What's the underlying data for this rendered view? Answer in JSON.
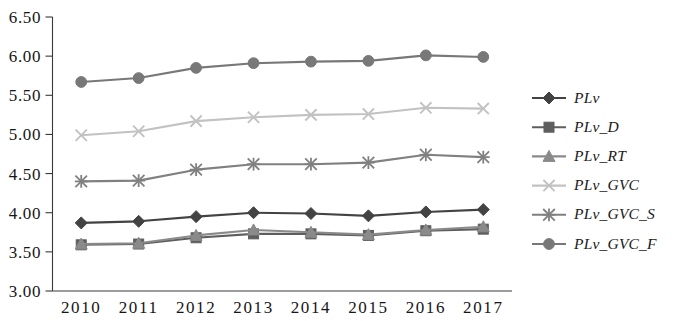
{
  "chart_data": {
    "type": "line",
    "title": "",
    "subtitle": "",
    "xlabel": "",
    "ylabel": "",
    "categories": [
      "2010",
      "2011",
      "2012",
      "2013",
      "2014",
      "2015",
      "2016",
      "2017"
    ],
    "x": [
      2010,
      2011,
      2012,
      2013,
      2014,
      2015,
      2016,
      2017
    ],
    "ylim": [
      3.0,
      6.5
    ],
    "yticks": [
      "3.00",
      "3.50",
      "4.00",
      "4.50",
      "5.00",
      "5.50",
      "6.00",
      "6.50"
    ],
    "ytick_values": [
      3.0,
      3.5,
      4.0,
      4.5,
      5.0,
      5.5,
      6.0,
      6.5
    ],
    "grid": false,
    "legend_position": "right",
    "series": [
      {
        "name": "PLv",
        "marker": "diamond",
        "color": "#434343",
        "values": [
          3.87,
          3.89,
          3.95,
          4.0,
          3.99,
          3.96,
          4.01,
          4.04
        ]
      },
      {
        "name": "PLv_D",
        "marker": "square",
        "color": "#5e5e5e",
        "values": [
          3.59,
          3.6,
          3.68,
          3.73,
          3.73,
          3.71,
          3.77,
          3.79
        ]
      },
      {
        "name": "PLv_RT",
        "marker": "triangle",
        "color": "#8a8a8a",
        "values": [
          3.6,
          3.61,
          3.71,
          3.78,
          3.75,
          3.72,
          3.78,
          3.82
        ]
      },
      {
        "name": "PLv_GVC",
        "marker": "x",
        "color": "#c2c2c2",
        "values": [
          4.99,
          5.04,
          5.17,
          5.22,
          5.25,
          5.26,
          5.34,
          5.33
        ]
      },
      {
        "name": "PLv_GVC_S",
        "marker": "asterisk",
        "color": "#808080",
        "values": [
          4.4,
          4.41,
          4.55,
          4.62,
          4.62,
          4.64,
          4.74,
          4.71
        ]
      },
      {
        "name": "PLv_GVC_F",
        "marker": "circle",
        "color": "#787878",
        "values": [
          5.67,
          5.72,
          5.85,
          5.91,
          5.93,
          5.94,
          6.01,
          5.99
        ]
      }
    ]
  }
}
